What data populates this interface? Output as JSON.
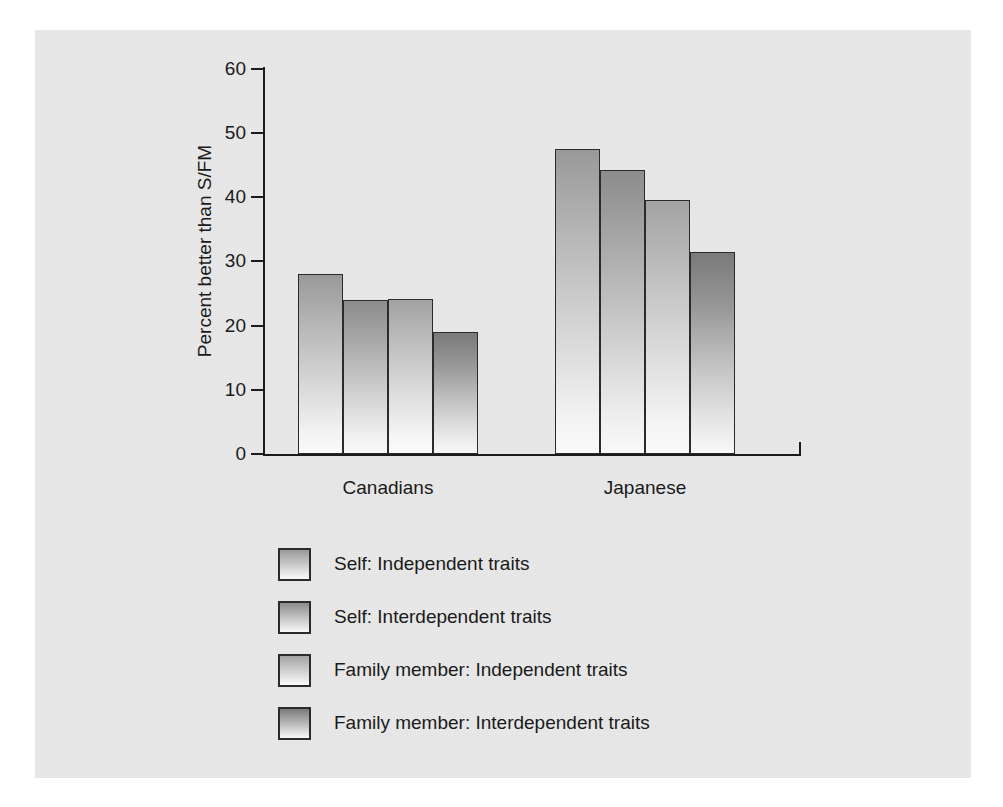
{
  "chart_data": {
    "type": "bar",
    "title": "",
    "xlabel": "",
    "ylabel": "Percent better than S/FM",
    "ylim": [
      0,
      60
    ],
    "yticks": [
      0,
      10,
      20,
      30,
      40,
      50,
      60
    ],
    "ytick_labels": [
      "0",
      "10",
      "20",
      "30",
      "40",
      "50",
      "60"
    ],
    "grid": false,
    "legend_position": "below-plot-left",
    "categories": [
      "Canadians",
      "Japanese"
    ],
    "series": [
      {
        "name": "Self: Independent traits",
        "values": [
          28.0,
          47.5
        ],
        "color_top": "#999999",
        "color_bottom": "#fafafa"
      },
      {
        "name": "Self: Interdependent traits",
        "values": [
          24.0,
          44.3
        ],
        "color_top": "#8c8c8c",
        "color_bottom": "#f9f9f9"
      },
      {
        "name": "Family member: Independent traits",
        "values": [
          24.1,
          39.5
        ],
        "color_top": "#a2a2a2",
        "color_bottom": "#fbfbfb"
      },
      {
        "name": "Family member: Interdependent traits",
        "values": [
          19.0,
          31.5
        ],
        "color_top": "#7a7a7a",
        "color_bottom": "#f8f8f8"
      }
    ],
    "panel_color": "#e9e9e9",
    "axis_color": "#1c1c1c",
    "text_color": "#1a1a1a"
  }
}
